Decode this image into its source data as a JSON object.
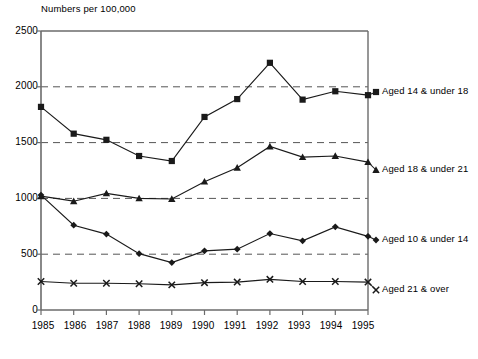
{
  "chart_data": {
    "type": "line",
    "title": "Numbers per 100,000",
    "xlabel": "",
    "ylabel": "Numbers per 100,000",
    "xlim": [
      1985,
      1995
    ],
    "ylim": [
      0,
      2500
    ],
    "yticks": [
      0,
      500,
      1000,
      1500,
      2000,
      2500
    ],
    "grid": "horizontal-dashed",
    "legend_position": "right-of-plot-at-line-end",
    "categories": [
      1985,
      1986,
      1987,
      1988,
      1989,
      1990,
      1991,
      1992,
      1993,
      1994,
      1995
    ],
    "x": [
      "1985",
      "1986",
      "1987",
      "1988",
      "1989",
      "1990",
      "1991",
      "1992",
      "1993",
      "1994",
      "1995"
    ],
    "series": [
      {
        "name": "Aged 14 & under 18",
        "marker": "square",
        "values": [
          1820,
          1580,
          1525,
          1380,
          1335,
          1730,
          1890,
          2215,
          1885,
          1960,
          1925
        ]
      },
      {
        "name": "Aged 18 & under 21",
        "marker": "triangle",
        "values": [
          1020,
          975,
          1045,
          1000,
          995,
          1150,
          1275,
          1465,
          1370,
          1380,
          1325
        ]
      },
      {
        "name": "Aged 10 & under 14",
        "marker": "diamond",
        "values": [
          1030,
          760,
          680,
          505,
          425,
          530,
          545,
          685,
          620,
          745,
          660
        ]
      },
      {
        "name": "Aged 21 & over",
        "marker": "x",
        "values": [
          255,
          240,
          240,
          235,
          225,
          245,
          250,
          275,
          255,
          255,
          250
        ]
      }
    ]
  },
  "ytick_labels": [
    "0",
    "500",
    "1000",
    "1500",
    "2000",
    "2500"
  ],
  "xtick_labels": [
    "1985",
    "1986",
    "1987",
    "1988",
    "1989",
    "1990",
    "1991",
    "1992",
    "1993",
    "1994",
    "1995"
  ],
  "legend": {
    "items": [
      {
        "label": "Aged 14 & under 18"
      },
      {
        "label": "Aged 18 & under 21"
      },
      {
        "label": "Aged 10 & under 14"
      },
      {
        "label": "Aged 21 & over"
      }
    ]
  },
  "colors": {
    "line": "#1a1a1a",
    "grid": "#555555",
    "axis": "#6b6b6b",
    "text": "#000000",
    "background": "#ffffff"
  }
}
